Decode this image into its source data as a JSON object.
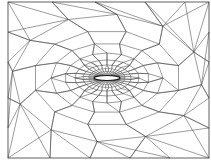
{
  "figure": {
    "title": "",
    "frame": {
      "x": 8,
      "y": 2,
      "width": 201,
      "height": 156
    },
    "airfoil": {
      "cx": 107,
      "cy": 78,
      "chord": 26,
      "thickness": 5,
      "leading_edge_x": 94,
      "trailing_edge_x": 120
    },
    "rings": [
      {
        "rx": 9,
        "ry": 4,
        "n": 36,
        "phase": 0
      },
      {
        "rx": 13,
        "ry": 6.5,
        "n": 36,
        "phase": 0.5
      },
      {
        "rx": 18,
        "ry": 9.5,
        "n": 34,
        "phase": 0
      },
      {
        "rx": 24,
        "ry": 13,
        "n": 30,
        "phase": 0.5
      },
      {
        "rx": 32,
        "ry": 18,
        "n": 24,
        "phase": 0
      },
      {
        "rx": 42,
        "ry": 25,
        "n": 18,
        "phase": 0.5
      },
      {
        "rx": 56,
        "ry": 35,
        "n": 14,
        "phase": 0
      },
      {
        "rx": 74,
        "ry": 48,
        "n": 12,
        "phase": 0.5
      },
      {
        "rx": 95,
        "ry": 64,
        "n": 12,
        "phase": 0.2
      }
    ],
    "boundary_nodes": [
      [
        8,
        2
      ],
      [
        52,
        2
      ],
      [
        95,
        2
      ],
      [
        145,
        2
      ],
      [
        185,
        2
      ],
      [
        209,
        2
      ],
      [
        209,
        32
      ],
      [
        209,
        62
      ],
      [
        209,
        98
      ],
      [
        209,
        128
      ],
      [
        209,
        158
      ],
      [
        170,
        158
      ],
      [
        130,
        158
      ],
      [
        90,
        158
      ],
      [
        50,
        158
      ],
      [
        8,
        158
      ],
      [
        8,
        128
      ],
      [
        8,
        98
      ],
      [
        8,
        62
      ],
      [
        8,
        32
      ]
    ],
    "colors": {
      "background": "#ffffff",
      "edge": "#4a4a4a",
      "inner_edge": "#2a2a2a",
      "airfoil_fill": "#ffffff"
    }
  }
}
